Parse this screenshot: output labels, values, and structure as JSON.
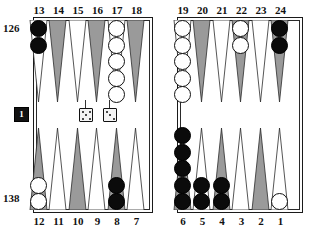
{
  "board": {
    "title": "Backgammon board position",
    "top_point_labels": [
      "13",
      "14",
      "15",
      "16",
      "17",
      "18",
      "19",
      "20",
      "21",
      "22",
      "23",
      "24"
    ],
    "bottom_point_labels": [
      "12",
      "11",
      "10",
      "9",
      "8",
      "7",
      "6",
      "5",
      "4",
      "3",
      "2",
      "1"
    ],
    "pip_count_top": "126",
    "pip_count_bottom": "138",
    "doubling_cube_value": "1",
    "colors": {
      "black_checker": "#0b0b0b",
      "white_checker": "#ffffff",
      "point_shaded": "#9a9a9a",
      "point_light": "#ffffff",
      "board_border": "#1a1a1a",
      "label_text": "#111111"
    },
    "dice": [
      {
        "name": "die-left",
        "value": "5"
      },
      {
        "name": "die-right",
        "value": "3"
      }
    ],
    "points": [
      {
        "point": "13",
        "checkers": 2,
        "color": "black",
        "from": "top"
      },
      {
        "point": "14",
        "checkers": 0,
        "color": "none",
        "from": "top"
      },
      {
        "point": "15",
        "checkers": 0,
        "color": "none",
        "from": "top"
      },
      {
        "point": "16",
        "checkers": 0,
        "color": "none",
        "from": "top"
      },
      {
        "point": "17",
        "checkers": 5,
        "color": "white",
        "from": "top"
      },
      {
        "point": "18",
        "checkers": 0,
        "color": "none",
        "from": "top"
      },
      {
        "point": "19",
        "checkers": 5,
        "color": "white",
        "from": "top"
      },
      {
        "point": "20",
        "checkers": 0,
        "color": "none",
        "from": "top"
      },
      {
        "point": "21",
        "checkers": 0,
        "color": "none",
        "from": "top"
      },
      {
        "point": "22",
        "checkers": 2,
        "color": "white",
        "from": "top"
      },
      {
        "point": "23",
        "checkers": 0,
        "color": "none",
        "from": "top"
      },
      {
        "point": "24",
        "checkers": 2,
        "color": "black",
        "from": "top"
      },
      {
        "point": "12",
        "checkers": 2,
        "color": "white",
        "from": "bottom"
      },
      {
        "point": "11",
        "checkers": 0,
        "color": "none",
        "from": "bottom"
      },
      {
        "point": "10",
        "checkers": 0,
        "color": "none",
        "from": "bottom"
      },
      {
        "point": "9",
        "checkers": 0,
        "color": "none",
        "from": "bottom"
      },
      {
        "point": "8",
        "checkers": 2,
        "color": "black",
        "from": "bottom"
      },
      {
        "point": "7",
        "checkers": 0,
        "color": "none",
        "from": "bottom"
      },
      {
        "point": "6",
        "checkers": 5,
        "color": "black",
        "from": "bottom"
      },
      {
        "point": "5",
        "checkers": 2,
        "color": "black",
        "from": "bottom"
      },
      {
        "point": "4",
        "checkers": 2,
        "color": "black",
        "from": "bottom"
      },
      {
        "point": "3",
        "checkers": 0,
        "color": "none",
        "from": "bottom"
      },
      {
        "point": "2",
        "checkers": 0,
        "color": "none",
        "from": "bottom"
      },
      {
        "point": "1",
        "checkers": 1,
        "color": "white",
        "from": "bottom"
      }
    ]
  }
}
